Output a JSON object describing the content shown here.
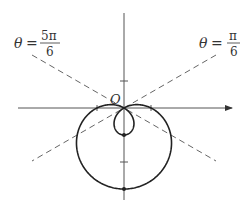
{
  "figure": {
    "type": "polar-curve-sketch",
    "curve": "limaçon with inner loop",
    "colors": {
      "curve": "#222222",
      "axes": "#555555",
      "dashed": "#666666",
      "text": "#333333",
      "background": "#ffffff"
    },
    "origin_label": "O",
    "left_line_label": {
      "theta": "θ",
      "equals": "=",
      "numerator": "5π",
      "denominator": "6"
    },
    "right_line_label": {
      "theta": "θ",
      "equals": "=",
      "numerator": "π",
      "denominator": "6"
    },
    "geometry": {
      "pole": [
        124,
        108
      ],
      "unit_px": 27,
      "polar_equation_sketched": "r = 1 - 2 sin θ (screen coordinates)",
      "dashed_angles": [
        "π/6",
        "5π/6"
      ]
    }
  }
}
